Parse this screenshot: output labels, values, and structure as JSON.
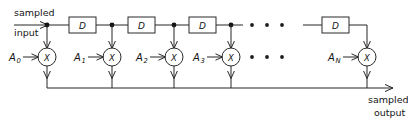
{
  "diagram": {
    "type": "signal-flow-block-diagram",
    "background_color": "#ffffff",
    "line_color": "#262626",
    "input": {
      "label_top": "sampled",
      "label_bottom": "input"
    },
    "output": {
      "label_top": "sampled",
      "label_bottom": "output"
    },
    "delay_elements": [
      {
        "id": "d1",
        "label": "D"
      },
      {
        "id": "d2",
        "label": "D"
      },
      {
        "id": "d3",
        "label": "D"
      },
      {
        "id": "d4",
        "label": "D"
      }
    ],
    "multipliers": [
      {
        "id": "m0",
        "symbol": "X"
      },
      {
        "id": "m1",
        "symbol": "X"
      },
      {
        "id": "m2",
        "symbol": "X"
      },
      {
        "id": "m3",
        "symbol": "X"
      },
      {
        "id": "mN",
        "symbol": "X"
      }
    ],
    "coefficients": [
      {
        "id": "a0",
        "base": "A",
        "subscript": "0"
      },
      {
        "id": "a1",
        "base": "A",
        "subscript": "1"
      },
      {
        "id": "a2",
        "base": "A",
        "subscript": "2"
      },
      {
        "id": "a3",
        "base": "A",
        "subscript": "3"
      },
      {
        "id": "aN",
        "base": "A",
        "subscript": "N"
      }
    ],
    "ellipsis": {
      "top_row": "• • •",
      "bottom_row": "• • •",
      "dot_count": 3
    }
  }
}
